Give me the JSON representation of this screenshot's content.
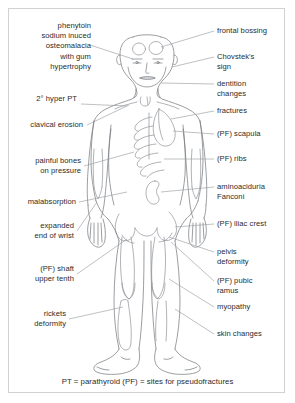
{
  "figure": {
    "title_caption": "PT = parathyroid (PF) = sites for pseudofractures",
    "border_color": "#d2d2d2",
    "line_color": "#7a7d82",
    "text_color": "#2b2b2b",
    "background_color": "#ffffff"
  },
  "labels_left": [
    {
      "id": "phenytoin",
      "text": "phenytoin\nsodium inuced\nosteomalacia\nwith gum\nhypertrophy",
      "anchor": "osteomalacia"
    },
    {
      "id": "hyper-pt",
      "text": "2° hyper PT",
      "anchor": "clavicle-region"
    },
    {
      "id": "clavical-erosion",
      "text": "clavical erosion",
      "anchor": "clavicle"
    },
    {
      "id": "painful-bones",
      "text": "painful bones\non pressure",
      "anchor": "long-bones"
    },
    {
      "id": "malabsorption",
      "text": "malabsorption",
      "anchor": "abdomen"
    },
    {
      "id": "expanded-wrist",
      "text": "expanded\nend of wrist",
      "anchor": "wrist"
    },
    {
      "id": "pf-shaft",
      "text": "(PF) shaft\nupper tenth",
      "anchor": "femur-shaft"
    },
    {
      "id": "rickets-deformity",
      "text": "rickets\ndeformity",
      "anchor": "tibia"
    }
  ],
  "labels_right": [
    {
      "id": "frontal-bossing",
      "text": "frontal bossing",
      "anchor": "skull-frontal"
    },
    {
      "id": "chovsteks-sign",
      "text": "Chovstek's\nsign",
      "anchor": "facial-nerve"
    },
    {
      "id": "dentition-changes",
      "text": "dentition\nchanges",
      "anchor": "jaw"
    },
    {
      "id": "fractures",
      "text": "fractures",
      "anchor": "upper-thorax"
    },
    {
      "id": "pf-scapula",
      "text": "(PF) scapula",
      "anchor": "scapula"
    },
    {
      "id": "pf-ribs",
      "text": "(PF) ribs",
      "anchor": "ribs"
    },
    {
      "id": "aminoaciduria",
      "text": "aminoaciduria\nFanconi",
      "anchor": "kidney"
    },
    {
      "id": "pf-iliac-crest",
      "text": "(PF) iliac crest",
      "anchor": "iliac-crest"
    },
    {
      "id": "pelvis-deformity",
      "text": "pelvis\ndeformity",
      "anchor": "pelvis"
    },
    {
      "id": "pf-pubic-ramus",
      "text": "(PF) pubic\nramus",
      "anchor": "pubic-ramus"
    },
    {
      "id": "myopathy",
      "text": "myopathy",
      "anchor": "thigh-muscle"
    },
    {
      "id": "skin-changes",
      "text": "skin changes",
      "anchor": "lower-leg-skin"
    }
  ],
  "legend": {
    "pt_abbrev": "PT = parathyroid",
    "pf_abbrev": "(PF) = sites for pseudofractures"
  }
}
